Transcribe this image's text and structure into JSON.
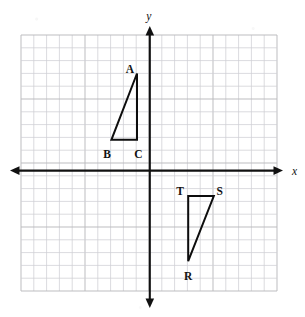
{
  "figure": {
    "kind": "coordinate-plane-with-triangles",
    "axis_labels": {
      "x": "x",
      "y": "y"
    },
    "colors": {
      "grid": "#b9b9bd",
      "grid_minor": "#cfcfd4",
      "axis": "#111111",
      "shape": "#0d0d0d",
      "label": "#121212",
      "background": "#ffffff"
    },
    "grid": {
      "columns": 20,
      "rows": 20,
      "cell_px": 12.8,
      "left_px": 21,
      "top_px": 35,
      "right_px": 277,
      "bottom_px": 291,
      "origin_col": 10,
      "origin_row": 10
    },
    "axes": {
      "x_axis_y_px": 170.6,
      "y_axis_x_px": 149.8,
      "x_left_tip_px": 10,
      "x_right_tip_px": 283,
      "y_top_tip_px": 26,
      "y_bottom_tip_px": 308
    }
  },
  "chart_data": {
    "type": "scatter",
    "title": "",
    "xlabel": "x",
    "ylabel": "y",
    "xlim": [
      -10,
      10
    ],
    "ylim": [
      -10,
      10
    ],
    "grid": true,
    "legend": "none",
    "unit_px": 12.8,
    "shapes": [
      {
        "name": "triangle-abc",
        "label": "ABC",
        "closed": true,
        "right_angle_at": "C",
        "vertices": [
          {
            "label": "A",
            "x": -1,
            "y": 7.5,
            "px": [
              137.0,
              73.5
            ],
            "label_px": [
              134.0,
              70.0
            ],
            "label_anchor": "end"
          },
          {
            "label": "B",
            "x": -3,
            "y": 2.4,
            "px": [
              111.4,
              139.8
            ],
            "label_px": [
              107.0,
              155.0
            ],
            "label_anchor": "middle"
          },
          {
            "label": "C",
            "x": -1,
            "y": 2.4,
            "px": [
              137.0,
              139.8
            ],
            "label_px": [
              138.5,
              155.0
            ],
            "label_anchor": "middle"
          }
        ]
      },
      {
        "name": "triangle-rst",
        "label": "RST",
        "closed": true,
        "right_angle_at": "T",
        "vertices": [
          {
            "label": "R",
            "x": 3,
            "y": -7,
            "px": [
              188.2,
              261.2
            ],
            "label_px": [
              188.2,
              277.0
            ],
            "label_anchor": "middle"
          },
          {
            "label": "S",
            "x": 5,
            "y": -2,
            "px": [
              213.8,
              196.0
            ],
            "label_px": [
              216.5,
              192.0
            ],
            "label_anchor": "start"
          },
          {
            "label": "T",
            "x": 3,
            "y": -2,
            "px": [
              188.2,
              196.0
            ],
            "label_px": [
              184.0,
              192.0
            ],
            "label_anchor": "end"
          }
        ]
      }
    ]
  }
}
